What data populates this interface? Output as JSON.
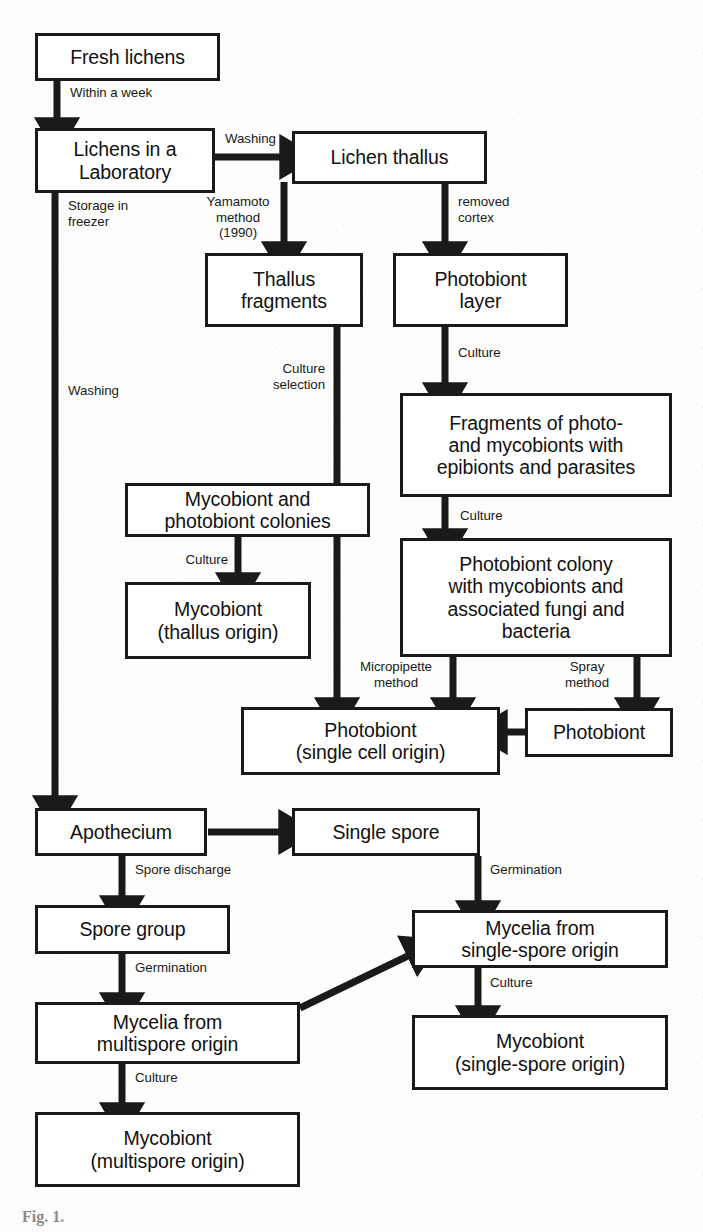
{
  "diagram": {
    "type": "flowchart",
    "colors": {
      "stroke": "#1a1a1a",
      "fill": "#ffffff",
      "page": "#fdfdfb"
    },
    "nodes": [
      {
        "id": "fresh_lichens",
        "label": "Fresh lichens"
      },
      {
        "id": "lichens_lab",
        "label": "Lichens in a\nLaboratory"
      },
      {
        "id": "lichen_thallus",
        "label": "Lichen thallus"
      },
      {
        "id": "thallus_fragments",
        "label": "Thallus\nfragments"
      },
      {
        "id": "photobiont_layer",
        "label": "Photobiont\nlayer"
      },
      {
        "id": "fragments_photo",
        "label": "Fragments of photo-\nand mycobionts with\nepibionts and parasites"
      },
      {
        "id": "myco_photo_colonies",
        "label": "Mycobiont and\nphotobiont colonies"
      },
      {
        "id": "photobiont_colony",
        "label": "Photobiont colony\nwith mycobionts and\nassociated fungi and\nbacteria"
      },
      {
        "id": "mycobiont_thallus",
        "label": "Mycobiont\n(thallus origin)"
      },
      {
        "id": "photobiont_single",
        "label": "Photobiont\n(single cell origin)"
      },
      {
        "id": "photobiont",
        "label": "Photobiont"
      },
      {
        "id": "apothecium",
        "label": "Apothecium"
      },
      {
        "id": "single_spore",
        "label": "Single spore"
      },
      {
        "id": "spore_group",
        "label": "Spore group"
      },
      {
        "id": "mycelia_multispore",
        "label": "Mycelia from\nmultispore origin"
      },
      {
        "id": "mycelia_singlespore",
        "label": "Mycelia from\nsingle-spore origin"
      },
      {
        "id": "mycobiont_multi",
        "label": "Mycobiont\n(multispore origin)"
      },
      {
        "id": "mycobiont_single",
        "label": "Mycobiont\n(single-spore origin)"
      }
    ],
    "edges": [
      {
        "id": "e_within_week",
        "from": "fresh_lichens",
        "to": "lichens_lab",
        "label": "Within a week"
      },
      {
        "id": "e_washing_1",
        "from": "lichens_lab",
        "to": "lichen_thallus",
        "label": "Washing"
      },
      {
        "id": "e_storage",
        "from": "lichens_lab",
        "to": "apothecium",
        "label": "Storage in\nfreezer"
      },
      {
        "id": "e_washing_2",
        "from": "lichens_lab",
        "to": "apothecium",
        "label": "Washing"
      },
      {
        "id": "e_yamamoto",
        "from": "lichen_thallus",
        "to": "thallus_fragments",
        "label": "Yamamoto\nmethod\n(1990)"
      },
      {
        "id": "e_removed_cortex",
        "from": "lichen_thallus",
        "to": "photobiont_layer",
        "label": "removed\ncortex"
      },
      {
        "id": "e_culture_sel",
        "from": "thallus_fragments",
        "to": "photobiont_single",
        "label": "Culture\nselection"
      },
      {
        "id": "e_culture_pl",
        "from": "photobiont_layer",
        "to": "fragments_photo",
        "label": "Culture"
      },
      {
        "id": "e_culture_fp",
        "from": "fragments_photo",
        "to": "photobiont_colony",
        "label": "Culture"
      },
      {
        "id": "e_culture_mpc",
        "from": "myco_photo_colonies",
        "to": "mycobiont_thallus",
        "label": "Culture"
      },
      {
        "id": "e_micropipette",
        "from": "photobiont_colony",
        "to": "photobiont_single",
        "label": "Micropipette\nmethod"
      },
      {
        "id": "e_spray",
        "from": "photobiont_colony",
        "to": "photobiont",
        "label": "Spray\nmethod"
      },
      {
        "id": "e_photo_to_single",
        "from": "photobiont",
        "to": "photobiont_single",
        "label": ""
      },
      {
        "id": "e_apo_single",
        "from": "apothecium",
        "to": "single_spore",
        "label": ""
      },
      {
        "id": "e_spore_discharge",
        "from": "apothecium",
        "to": "spore_group",
        "label": "Spore discharge"
      },
      {
        "id": "e_germ_group",
        "from": "spore_group",
        "to": "mycelia_multispore",
        "label": "Germination"
      },
      {
        "id": "e_germ_single",
        "from": "single_spore",
        "to": "mycelia_singlespore",
        "label": "Germination"
      },
      {
        "id": "e_multi_to_single",
        "from": "mycelia_multispore",
        "to": "mycelia_singlespore",
        "label": ""
      },
      {
        "id": "e_culture_multi",
        "from": "mycelia_multispore",
        "to": "mycobiont_multi",
        "label": "Culture"
      },
      {
        "id": "e_culture_single",
        "from": "mycelia_singlespore",
        "to": "mycobiont_single",
        "label": "Culture"
      }
    ],
    "caption": "Fig. 1."
  }
}
